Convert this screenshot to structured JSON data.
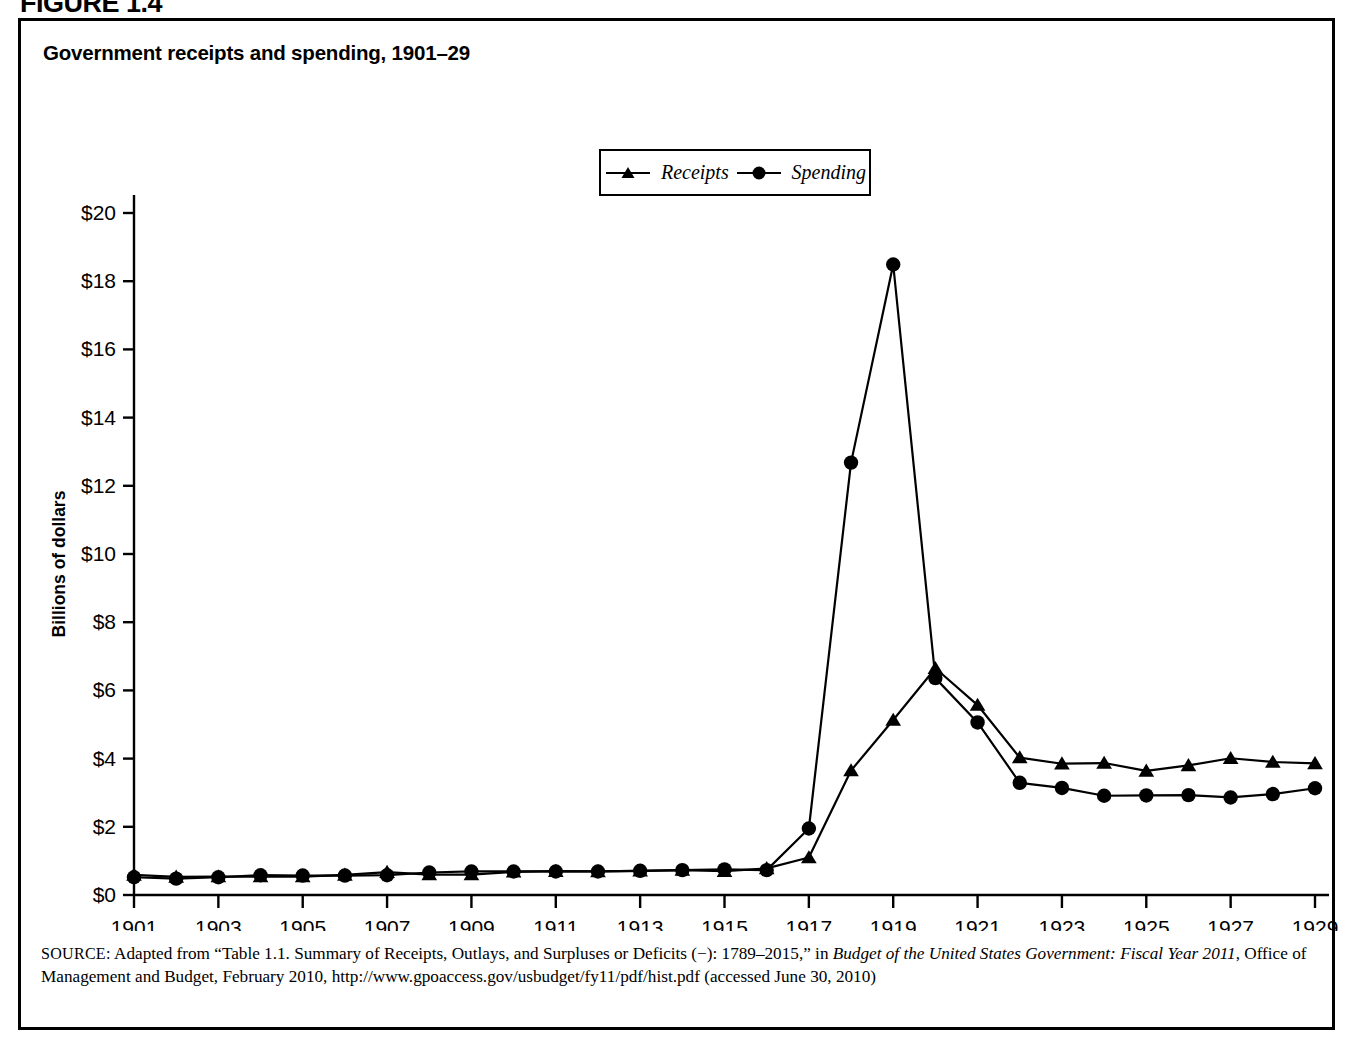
{
  "figure": {
    "label": "FIGURE 1.4",
    "title": "Government receipts and spending, 1901–29"
  },
  "source": {
    "label": "SOURCE:",
    "text_part1": " Adapted from “Table 1.1. Summary of Receipts, Outlays, and Surpluses or Deficits (−): 1789–2015,” in ",
    "italic1": "Budget of the United States Government: Fiscal Year 2011",
    "text_part2": ", Office of Management and Budget, February 2010, http://www.gpoaccess.gov/usbudget/fy11/pdf/hist.pdf (accessed June 30, 2010)"
  },
  "chart_data": {
    "type": "line",
    "title": "Government receipts and spending, 1901–29",
    "xlabel": "",
    "ylabel": "Billions of dollars",
    "ylim": [
      0,
      20
    ],
    "ytick_labels": [
      "$0",
      "$2",
      "$4",
      "$6",
      "$8",
      "$10",
      "$12",
      "$14",
      "$16",
      "$18",
      "$20"
    ],
    "ytick_values": [
      0,
      2,
      4,
      6,
      8,
      10,
      12,
      14,
      16,
      18,
      20
    ],
    "xlim": [
      1901,
      1929
    ],
    "xtick_labels": [
      "1901",
      "1903",
      "1905",
      "1907",
      "1909",
      "1911",
      "1913",
      "1915",
      "1917",
      "1919",
      "1921",
      "1923",
      "1925",
      "1927",
      "1929"
    ],
    "xtick_values": [
      1901,
      1903,
      1905,
      1907,
      1909,
      1911,
      1913,
      1915,
      1917,
      1919,
      1921,
      1923,
      1925,
      1927,
      1929
    ],
    "grid": false,
    "legend_position": "top-center",
    "x": [
      1901,
      1902,
      1903,
      1904,
      1905,
      1906,
      1907,
      1908,
      1909,
      1910,
      1911,
      1912,
      1913,
      1914,
      1915,
      1916,
      1917,
      1918,
      1919,
      1920,
      1921,
      1922,
      1923,
      1924,
      1925,
      1926,
      1927,
      1928,
      1929
    ],
    "series": [
      {
        "name": "Receipts",
        "marker": "triangle",
        "color": "#000000",
        "values": [
          0.59,
          0.53,
          0.54,
          0.54,
          0.54,
          0.59,
          0.67,
          0.6,
          0.6,
          0.68,
          0.7,
          0.69,
          0.71,
          0.73,
          0.7,
          0.78,
          1.1,
          3.65,
          5.13,
          6.65,
          5.57,
          4.03,
          3.85,
          3.87,
          3.64,
          3.8,
          4.01,
          3.9,
          3.86
        ]
      },
      {
        "name": "Spending",
        "marker": "circle",
        "color": "#000000",
        "values": [
          0.52,
          0.48,
          0.52,
          0.58,
          0.57,
          0.57,
          0.58,
          0.66,
          0.69,
          0.69,
          0.69,
          0.69,
          0.71,
          0.73,
          0.75,
          0.73,
          1.95,
          12.68,
          18.49,
          6.36,
          5.06,
          3.29,
          3.14,
          2.91,
          2.92,
          2.93,
          2.86,
          2.96,
          3.13
        ]
      }
    ]
  },
  "legend": {
    "entries": [
      {
        "label": "Receipts",
        "marker": "triangle"
      },
      {
        "label": "Spending",
        "marker": "circle"
      }
    ]
  }
}
